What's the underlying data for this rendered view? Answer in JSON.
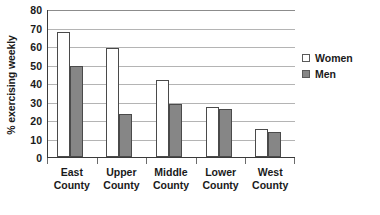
{
  "chart_data": {
    "type": "bar",
    "title": "",
    "xlabel": "",
    "ylabel": "% exercising weekly",
    "ylim": [
      0,
      80
    ],
    "ytick_step": 10,
    "yticks": [
      80,
      70,
      60,
      50,
      40,
      30,
      20,
      10,
      0
    ],
    "grid": true,
    "legend_position": "right",
    "categories": [
      "East County",
      "Upper County",
      "Middle County",
      "Lower County",
      "West County"
    ],
    "category_lines": [
      [
        "East",
        "County"
      ],
      [
        "Upper",
        "County"
      ],
      [
        "Middle",
        "County"
      ],
      [
        "Lower",
        "County"
      ],
      [
        "West",
        "County"
      ]
    ],
    "series": [
      {
        "name": "Women",
        "color": "#ffffff",
        "values": [
          67.5,
          59,
          41.5,
          27,
          15
        ]
      },
      {
        "name": "Men",
        "color": "#868686",
        "values": [
          49,
          23.5,
          28.5,
          26,
          13.5
        ]
      }
    ]
  },
  "legend": {
    "items": [
      {
        "label": "Women",
        "swatch": "women"
      },
      {
        "label": "Men",
        "swatch": "men"
      }
    ]
  },
  "colors": {
    "women_fill": "#ffffff",
    "men_fill": "#868686",
    "bar_stroke": "#4a4a4a",
    "gridline": "#b4b4b4",
    "axis": "#3a3a3a",
    "text": "#1a1a1a"
  }
}
